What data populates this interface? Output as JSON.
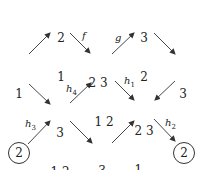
{
  "diagram": {
    "nodes": {
      "left": {
        "rows": [
          "1"
        ]
      },
      "top_left": {
        "rows": [
          "2",
          "1"
        ]
      },
      "center": {
        "rows": [
          "2 3",
          "1 2"
        ]
      },
      "top_right": {
        "rows": [
          "3",
          "2"
        ]
      },
      "right": {
        "rows": [
          "3"
        ]
      },
      "mid_left": {
        "rows": [
          "3",
          "1 2"
        ]
      },
      "mid_right": {
        "rows": [
          "2 3",
          "1"
        ]
      },
      "bottom": {
        "rows": [
          "3",
          "1"
        ]
      },
      "circled_left": {
        "label": "2"
      },
      "circled_right": {
        "label": "2"
      }
    },
    "edge_labels": {
      "f": {
        "base": "f",
        "sub": ""
      },
      "g": {
        "base": "g",
        "sub": ""
      },
      "h1": {
        "base": "h",
        "sub": "1"
      },
      "h2": {
        "base": "h",
        "sub": "2"
      },
      "h3": {
        "base": "h",
        "sub": "3"
      },
      "h4": {
        "base": "h",
        "sub": "4"
      }
    },
    "colors": {
      "stroke": "#333333",
      "text": "#222222"
    }
  }
}
